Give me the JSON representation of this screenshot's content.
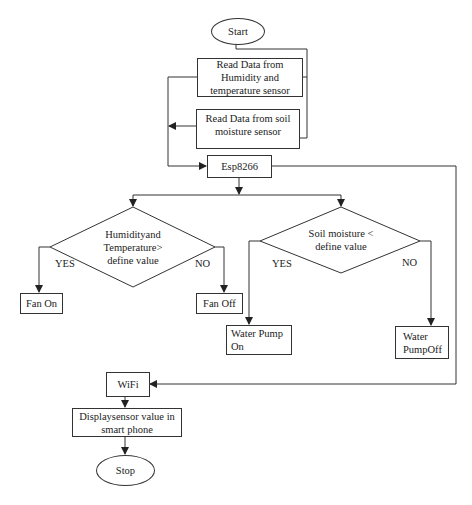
{
  "flowchart": {
    "start": "Start",
    "read_humidity": "Read Data from Humidity and temperature sensor",
    "read_soil": "Read Data from soil moisture sensor",
    "esp": "Esp8266",
    "decision_humidity": "Humidityand Temperature> define value",
    "decision_soil": "Soil moisture < define value",
    "fan_on": "Fan On",
    "fan_off": "Fan Off",
    "pump_on": "Water Pump On",
    "pump_off": "Water PumpOff",
    "wifi": "WiFi",
    "display": "Displaysensor value in smart phone",
    "stop": "Stop",
    "yes_label": "YES",
    "no_label": "NO"
  },
  "colors": {
    "line": "#333333",
    "background": "#ffffff"
  }
}
